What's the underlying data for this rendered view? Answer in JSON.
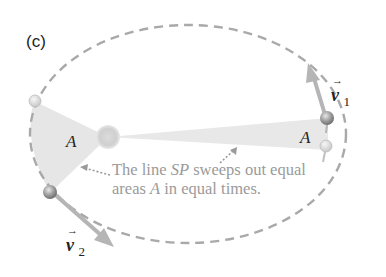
{
  "panel_label": "(c)",
  "area_label": "A",
  "velocity_1": {
    "symbol": "v",
    "subscript": "1"
  },
  "velocity_2": {
    "symbol": "v",
    "subscript": "2"
  },
  "caption": {
    "line1_pre": "The line ",
    "line1_ital": "SP",
    "line1_post": " sweeps out equal",
    "line2_pre": "areas ",
    "line2_ital": "A",
    "line2_post": " in equal times."
  },
  "colors": {
    "orbit": "#a9a9a9",
    "wedge": "#e6e6e6",
    "arrow": "#b5b5b5",
    "caption": "#9a9a9a",
    "sun": "#d0d0d0"
  }
}
